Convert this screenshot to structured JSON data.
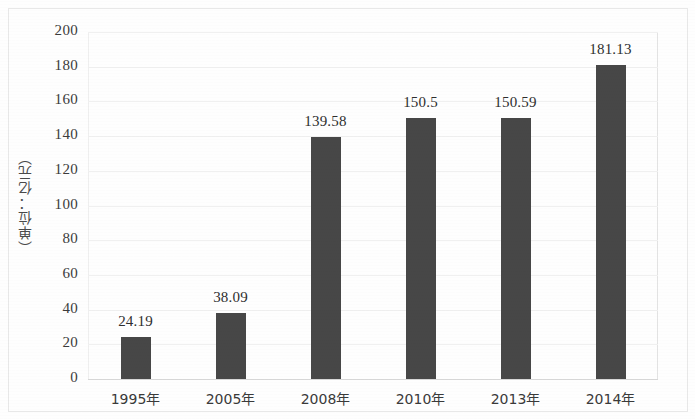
{
  "chart_data": {
    "type": "bar",
    "title": "",
    "subtitle": "",
    "xlabel": "",
    "ylabel": "（单位：亿元）",
    "categories": [
      "1995年",
      "2005年",
      "2008年",
      "2010年",
      "2013年",
      "2014年"
    ],
    "values": [
      24.19,
      38.09,
      139.58,
      150.5,
      150.59,
      181.13
    ],
    "value_labels": [
      "24.19",
      "38.09",
      "139.58",
      "150.5",
      "150.59",
      "181.13"
    ],
    "ylim": [
      0,
      200
    ],
    "ytick_labels": [
      "0",
      "20",
      "40",
      "60",
      "80",
      "100",
      "120",
      "140",
      "160",
      "180",
      "200"
    ],
    "ytick_values": [
      0,
      20,
      40,
      60,
      80,
      100,
      120,
      140,
      160,
      180,
      200
    ],
    "grid": true,
    "legend": false,
    "legend_position": "none",
    "series": [
      {
        "name": "",
        "values": [
          24.19,
          38.09,
          139.58,
          150.5,
          150.59,
          181.13
        ]
      }
    ],
    "colors": {
      "bar": "#474747",
      "grid": "#f0f0f0",
      "axis": "#d8d8d8",
      "text": "#2e2e2e",
      "background": "#fefefe"
    }
  }
}
